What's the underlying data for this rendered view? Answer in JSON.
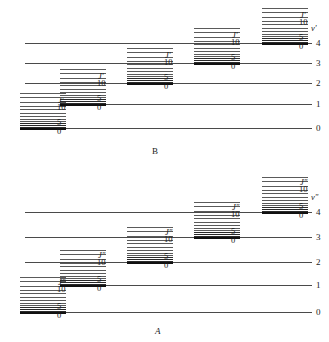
{
  "figure": {
    "type": "energy-level-diagram"
  },
  "panels": [
    {
      "id": "B",
      "caption": "B",
      "caption_italic": false,
      "vib_symbol": "v'",
      "rot_symbol": "J'",
      "vib_levels": [
        {
          "label": "0",
          "y": 128,
          "x_start": 64,
          "x_end": 312
        },
        {
          "label": "1",
          "y": 104,
          "x_start": 64,
          "x_end": 312
        },
        {
          "label": "2",
          "y": 83,
          "x_start": 25,
          "x_end": 312
        },
        {
          "label": "3",
          "y": 63,
          "x_start": 25,
          "x_end": 312
        },
        {
          "label": "4",
          "y": 43,
          "x_start": 25,
          "x_end": 312
        }
      ],
      "rot_stacks": [
        {
          "vib": "0",
          "x": 20,
          "width": 46,
          "baseline_y": 128,
          "j_label_x": 58,
          "j_label_y": 96,
          "j5_x": 57,
          "j5_y": 118,
          "j0_x": 57,
          "j0_y": 127,
          "j10_x": 57,
          "j10_y": 103
        },
        {
          "vib": "1",
          "x": 60,
          "width": 46,
          "baseline_y": 104,
          "j_label_x": 98,
          "j_label_y": 72,
          "j5_x": 97,
          "j5_y": 94,
          "j0_x": 97,
          "j0_y": 103,
          "j10_x": 97,
          "j10_y": 79
        },
        {
          "vib": "2",
          "x": 127,
          "width": 46,
          "baseline_y": 83,
          "j_label_x": 165,
          "j_label_y": 51,
          "j5_x": 164,
          "j5_y": 73,
          "j0_x": 164,
          "j0_y": 82,
          "j10_x": 164,
          "j10_y": 58
        },
        {
          "vib": "3",
          "x": 194,
          "width": 46,
          "baseline_y": 63,
          "j_label_x": 232,
          "j_label_y": 31,
          "j5_x": 231,
          "j5_y": 53,
          "j0_x": 231,
          "j0_y": 62,
          "j10_x": 231,
          "j10_y": 38
        },
        {
          "vib": "4",
          "x": 262,
          "width": 46,
          "baseline_y": 43,
          "j_label_x": 300,
          "j_label_y": 11,
          "j5_x": 299,
          "j5_y": 33,
          "j0_x": 299,
          "j0_y": 42,
          "j10_x": 299,
          "j10_y": 18
        }
      ],
      "j_tick_labels": {
        "zero": "0",
        "five": "5",
        "ten": "10"
      },
      "caption_x": 152,
      "caption_y": 147
    },
    {
      "id": "A",
      "caption": "A",
      "caption_italic": true,
      "vib_symbol": "v\"",
      "rot_symbol": "J\"",
      "vib_levels": [
        {
          "label": "0",
          "y": 141,
          "x_start": 64,
          "x_end": 312
        },
        {
          "label": "1",
          "y": 114,
          "x_start": 64,
          "x_end": 312
        },
        {
          "label": "2",
          "y": 91,
          "x_start": 25,
          "x_end": 312
        },
        {
          "label": "3",
          "y": 66,
          "x_start": 25,
          "x_end": 312
        },
        {
          "label": "4",
          "y": 41,
          "x_start": 25,
          "x_end": 312
        }
      ],
      "rot_stacks": [
        {
          "vib": "0",
          "x": 20,
          "width": 46,
          "baseline_y": 141,
          "j_label_x": 58,
          "j_label_y": 107,
          "j5_x": 57,
          "j5_y": 131,
          "j0_x": 57,
          "j0_y": 140,
          "j10_x": 57,
          "j10_y": 114
        },
        {
          "vib": "1",
          "x": 60,
          "width": 46,
          "baseline_y": 114,
          "j_label_x": 98,
          "j_label_y": 80,
          "j5_x": 97,
          "j5_y": 104,
          "j0_x": 97,
          "j0_y": 113,
          "j10_x": 97,
          "j10_y": 87
        },
        {
          "vib": "2",
          "x": 127,
          "width": 46,
          "baseline_y": 91,
          "j_label_x": 165,
          "j_label_y": 57,
          "j5_x": 164,
          "j5_y": 81,
          "j0_x": 164,
          "j0_y": 90,
          "j10_x": 164,
          "j10_y": 64
        },
        {
          "vib": "3",
          "x": 194,
          "width": 46,
          "baseline_y": 66,
          "j_label_x": 232,
          "j_label_y": 32,
          "j5_x": 231,
          "j5_y": 56,
          "j0_x": 231,
          "j0_y": 65,
          "j10_x": 231,
          "j10_y": 39
        },
        {
          "vib": "4",
          "x": 262,
          "width": 46,
          "baseline_y": 41,
          "j_label_x": 300,
          "j_label_y": 7,
          "j5_x": 299,
          "j5_y": 31,
          "j0_x": 299,
          "j0_y": 40,
          "j10_x": 299,
          "j10_y": 14
        }
      ],
      "j_tick_labels": {
        "zero": "0",
        "five": "5",
        "ten": "10"
      },
      "caption_x": 155,
      "caption_y": 156
    }
  ],
  "rotational_offsets": [
    0,
    1.3,
    2.9,
    4.8,
    7.0,
    9.5,
    12.3,
    15.4,
    18.8,
    22.5,
    26.5,
    30.8,
    35.4
  ]
}
